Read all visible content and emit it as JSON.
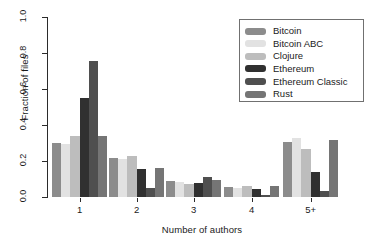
{
  "chart_data": {
    "type": "bar",
    "title": "",
    "xlabel": "Number of authors",
    "ylabel": "Fraction of files",
    "categories": [
      "1",
      "2",
      "3",
      "4",
      "5+"
    ],
    "ylim": [
      0.0,
      1.0
    ],
    "yticks": [
      "0.0",
      "0.2",
      "0.4",
      "0.6",
      "0.8",
      "1.0"
    ],
    "ytick_values": [
      0.0,
      0.2,
      0.4,
      0.6,
      0.8,
      1.0
    ],
    "grid": false,
    "legend_position": "top-right",
    "series": [
      {
        "name": "Bitcoin",
        "color": "#8c8c8c",
        "values": [
          0.3,
          0.215,
          0.09,
          0.055,
          0.305
        ]
      },
      {
        "name": "Bitcoin ABC",
        "color": "#e2e2e2",
        "values": [
          0.295,
          0.21,
          0.085,
          0.048,
          0.33
        ]
      },
      {
        "name": "Clojure",
        "color": "#bdbdbd",
        "values": [
          0.34,
          0.23,
          0.074,
          0.06,
          0.265
        ]
      },
      {
        "name": "Ethereum",
        "color": "#303030",
        "values": [
          0.55,
          0.155,
          0.08,
          0.044,
          0.14
        ]
      },
      {
        "name": "Ethereum Classic",
        "color": "#4f4f4f",
        "values": [
          0.755,
          0.05,
          0.11,
          0.012,
          0.035
        ]
      },
      {
        "name": "Rust",
        "color": "#757575",
        "values": [
          0.34,
          0.16,
          0.095,
          0.062,
          0.315
        ]
      }
    ]
  },
  "legend": {
    "entries": [
      {
        "label": "Bitcoin"
      },
      {
        "label": "Bitcoin ABC"
      },
      {
        "label": "Clojure"
      },
      {
        "label": "Ethereum"
      },
      {
        "label": "Ethereum Classic"
      },
      {
        "label": "Rust"
      }
    ]
  },
  "axes": {
    "x_title": "Number of authors",
    "y_title": "Fraction of files",
    "x_labels": [
      "1",
      "2",
      "3",
      "4",
      "5+"
    ],
    "y_labels": [
      "0.0",
      "0.2",
      "0.4",
      "0.6",
      "0.8",
      "1.0"
    ]
  }
}
